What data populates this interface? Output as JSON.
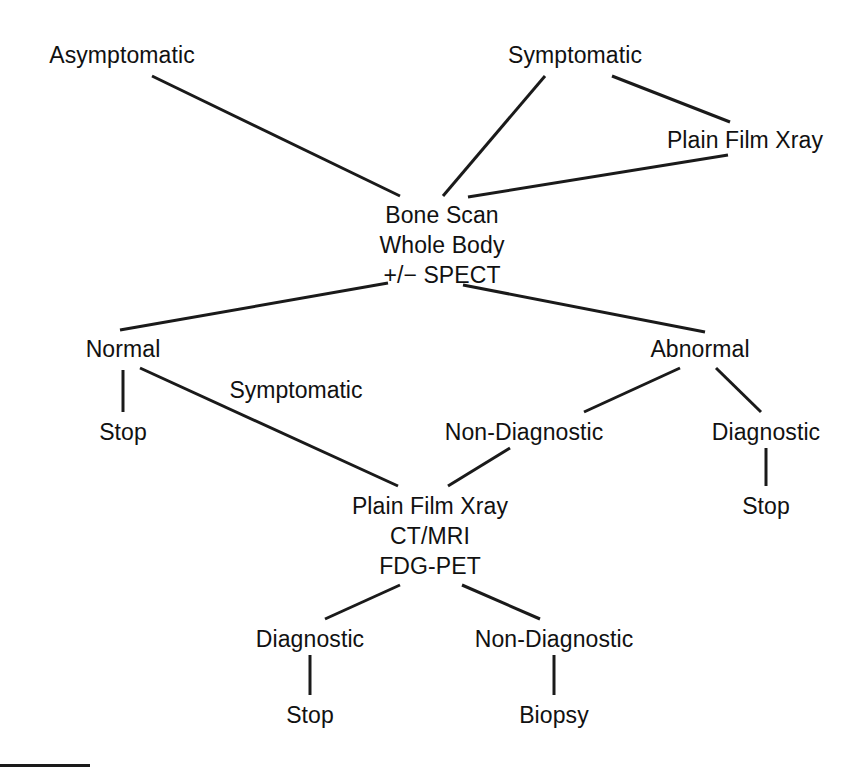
{
  "diagram": {
    "canvas": {
      "width": 859,
      "height": 780
    },
    "stroke_color": "#1a1a1a",
    "text_color": "#111111",
    "background_color": "#ffffff",
    "nodes": [
      {
        "id": "asymptomatic",
        "x": 122,
        "y": 40,
        "lines": [
          "Asymptomatic"
        ]
      },
      {
        "id": "symptomatic_top",
        "x": 575,
        "y": 40,
        "lines": [
          "Symptomatic"
        ]
      },
      {
        "id": "plain_film_top",
        "x": 745,
        "y": 125,
        "lines": [
          "Plain Film Xray"
        ]
      },
      {
        "id": "bone_scan",
        "x": 442,
        "y": 200,
        "lines": [
          "Bone Scan",
          "Whole Body",
          "+/− SPECT"
        ]
      },
      {
        "id": "normal",
        "x": 123,
        "y": 334,
        "lines": [
          "Normal"
        ]
      },
      {
        "id": "abnormal",
        "x": 700,
        "y": 334,
        "lines": [
          "Abnormal"
        ]
      },
      {
        "id": "stop_normal",
        "x": 123,
        "y": 417,
        "lines": [
          "Stop"
        ]
      },
      {
        "id": "non_diagnostic_1",
        "x": 524,
        "y": 417,
        "lines": [
          "Non-Diagnostic"
        ]
      },
      {
        "id": "diagnostic_1",
        "x": 766,
        "y": 417,
        "lines": [
          "Diagnostic"
        ]
      },
      {
        "id": "stop_diagnostic_1",
        "x": 766,
        "y": 491,
        "lines": [
          "Stop"
        ]
      },
      {
        "id": "workup",
        "x": 430,
        "y": 491,
        "lines": [
          "Plain Film Xray",
          "CT/MRI",
          "FDG-PET"
        ]
      },
      {
        "id": "diagnostic_2",
        "x": 310,
        "y": 624,
        "lines": [
          "Diagnostic"
        ]
      },
      {
        "id": "non_diagnostic_2",
        "x": 554,
        "y": 624,
        "lines": [
          "Non-Diagnostic"
        ]
      },
      {
        "id": "stop_diagnostic_2",
        "x": 310,
        "y": 700,
        "lines": [
          "Stop"
        ]
      },
      {
        "id": "biopsy",
        "x": 554,
        "y": 700,
        "lines": [
          "Biopsy"
        ]
      }
    ],
    "edges": [
      {
        "id": "asymptomatic-bone_scan",
        "x1": 152,
        "y1": 76,
        "x2": 400,
        "y2": 196
      },
      {
        "id": "symptomatic_top-bone_scan",
        "x2": 443,
        "y2": 196,
        "x1": 545,
        "y1": 76
      },
      {
        "id": "symptomatic_top-plain_film",
        "x1": 612,
        "y1": 76,
        "x2": 730,
        "y2": 122
      },
      {
        "id": "plain_film_top-bone_scan",
        "x1": 728,
        "y1": 155,
        "x2": 468,
        "y2": 197
      },
      {
        "id": "bone_scan-normal",
        "x1": 388,
        "y1": 283,
        "x2": 120,
        "y2": 330
      },
      {
        "id": "bone_scan-abnormal",
        "x1": 463,
        "y1": 285,
        "x2": 705,
        "y2": 332
      },
      {
        "id": "normal-stop",
        "x1": 123,
        "y1": 370,
        "x2": 123,
        "y2": 412
      },
      {
        "id": "normal-workup",
        "x1": 140,
        "y1": 368,
        "x2": 398,
        "y2": 486
      },
      {
        "id": "abnormal-non_diagnostic",
        "x1": 680,
        "y1": 368,
        "x2": 584,
        "y2": 412
      },
      {
        "id": "abnormal-diagnostic",
        "x1": 716,
        "y1": 368,
        "x2": 761,
        "y2": 412
      },
      {
        "id": "diagnostic_1-stop",
        "x1": 766,
        "y1": 448,
        "x2": 766,
        "y2": 486
      },
      {
        "id": "non_diagnostic_1-workup",
        "x1": 510,
        "y1": 448,
        "x2": 448,
        "y2": 486
      },
      {
        "id": "workup-diagnostic_2",
        "x1": 400,
        "y1": 585,
        "x2": 325,
        "y2": 619
      },
      {
        "id": "workup-non_diagnostic_2",
        "x1": 462,
        "y1": 585,
        "x2": 540,
        "y2": 619
      },
      {
        "id": "diagnostic_2-stop",
        "x1": 310,
        "y1": 655,
        "x2": 310,
        "y2": 695
      },
      {
        "id": "non_diagnostic_2-biopsy",
        "x1": 554,
        "y1": 655,
        "x2": 554,
        "y2": 695
      }
    ],
    "edge_labels": [
      {
        "id": "symptomatic-branch-label",
        "x": 296,
        "y": 375,
        "text": "Symptomatic"
      }
    ],
    "footer_rule": {
      "x": 0,
      "y": 764,
      "width": 90,
      "height": 3
    }
  }
}
